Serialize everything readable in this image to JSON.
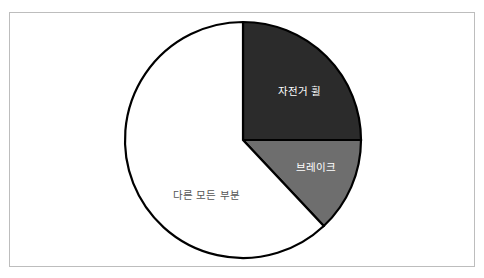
{
  "chart_data": {
    "type": "pie",
    "title": "",
    "start_angle_deg": 0,
    "direction": "clockwise",
    "slices": [
      {
        "label": "자전거 휠",
        "value": 25,
        "color": "#2b2b2b",
        "label_color": "#ffffff"
      },
      {
        "label": "브레이크",
        "value": 13,
        "color": "#6e6e6e",
        "label_color": "#ffffff"
      },
      {
        "label": "다른 모든 부분",
        "value": 62,
        "color": "#ffffff",
        "label_color": "#555555"
      }
    ],
    "categories": [
      "자전거 휠",
      "브레이크",
      "다른 모든 부분"
    ],
    "values": [
      25,
      13,
      62
    ],
    "legend": "none",
    "stroke_color": "#000000"
  },
  "labels": {
    "wheel": "자전거 휠",
    "brake": "브레이크",
    "other": "다른 모든 부분"
  }
}
